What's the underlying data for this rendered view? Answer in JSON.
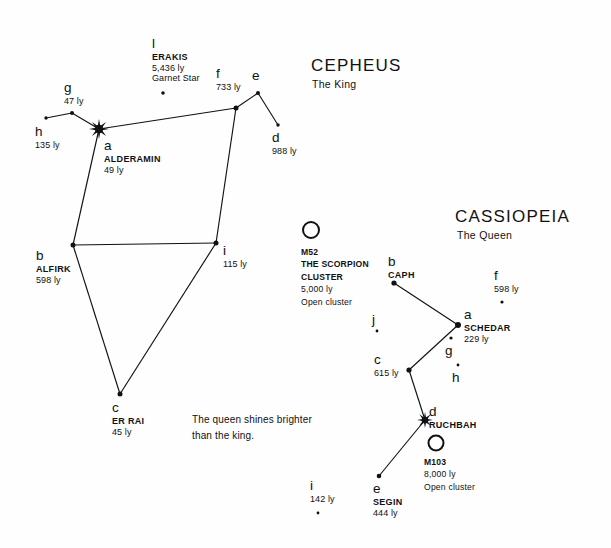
{
  "page": {
    "width": 611,
    "height": 548,
    "background": "#fefefe",
    "ink": "#111111"
  },
  "constellations": [
    {
      "id": "cepheus",
      "title": "CEPHEUS",
      "subtitle": "The King",
      "title_pos": {
        "x": 311,
        "y": 56
      },
      "sub_pos": {
        "x": 312,
        "y": 78
      }
    },
    {
      "id": "cassiopeia",
      "title": "CASSIOPEIA",
      "subtitle": "The Queen",
      "title_pos": {
        "x": 455,
        "y": 207
      },
      "sub_pos": {
        "x": 457,
        "y": 229
      }
    }
  ],
  "note": {
    "line1": "The queen shines brighter",
    "line2": "than the king.",
    "pos": {
      "x": 192,
      "y": 412
    }
  },
  "stars": [
    {
      "id": "cep-a",
      "bayer": "a",
      "name": "ALDERAMIN",
      "distance": "49 ly",
      "x": 99,
      "y": 129,
      "marker": "burst",
      "size": 10,
      "label_pos": {
        "x": 104,
        "y": 138
      },
      "label_align": "left"
    },
    {
      "id": "cep-b",
      "bayer": "b",
      "name": "ALFIRK",
      "distance": "598 ly",
      "x": 73,
      "y": 245,
      "marker": "dot",
      "size": 5,
      "label_pos": {
        "x": 36,
        "y": 248
      },
      "label_align": "left"
    },
    {
      "id": "cep-c",
      "bayer": "c",
      "name": "ER RAI",
      "distance": "45 ly",
      "x": 120,
      "y": 394,
      "marker": "dot",
      "size": 5,
      "label_pos": {
        "x": 112,
        "y": 400
      },
      "label_align": "left"
    },
    {
      "id": "cep-d",
      "bayer": "d",
      "name": "",
      "distance": "988 ly",
      "x": 278,
      "y": 125,
      "marker": "dot",
      "size": 3.4,
      "label_pos": {
        "x": 272,
        "y": 130
      },
      "label_align": "left"
    },
    {
      "id": "cep-e",
      "bayer": "e",
      "name": "",
      "distance": "",
      "x": 258,
      "y": 93,
      "marker": "dot",
      "size": 4,
      "label_pos": {
        "x": 252,
        "y": 68
      },
      "label_align": "left"
    },
    {
      "id": "cep-f",
      "bayer": "f",
      "name": "",
      "distance": "733 ly",
      "x": 236,
      "y": 108,
      "marker": "dot",
      "size": 5,
      "label_pos": {
        "x": 216,
        "y": 66
      },
      "label_align": "left"
    },
    {
      "id": "cep-g",
      "bayer": "g",
      "name": "",
      "distance": "47 ly",
      "x": 72,
      "y": 113,
      "marker": "dot",
      "size": 4,
      "label_pos": {
        "x": 64,
        "y": 80
      },
      "label_align": "left"
    },
    {
      "id": "cep-h",
      "bayer": "h",
      "name": "",
      "distance": "135 ly",
      "x": 46,
      "y": 118,
      "marker": "dot",
      "size": 3.4,
      "label_pos": {
        "x": 35,
        "y": 124
      },
      "label_align": "left"
    },
    {
      "id": "cep-i",
      "bayer": "i",
      "name": "",
      "distance": "115 ly",
      "x": 216,
      "y": 243,
      "marker": "dot",
      "size": 5,
      "label_pos": {
        "x": 223,
        "y": 243
      },
      "label_align": "left"
    },
    {
      "id": "cep-l",
      "bayer": "l",
      "name": "ERAKIS",
      "distance": "5,436 ly",
      "x": 163,
      "y": 93,
      "marker": "dot",
      "size": 3.6,
      "label_pos": {
        "x": 152,
        "y": 36
      },
      "label_align": "left",
      "extra": "Garnet Star"
    },
    {
      "id": "cas-a",
      "bayer": "a",
      "name": "SCHEDAR",
      "distance": "229 ly",
      "x": 458,
      "y": 325,
      "marker": "dot",
      "size": 6,
      "label_pos": {
        "x": 464,
        "y": 307
      },
      "label_align": "left"
    },
    {
      "id": "cas-b",
      "bayer": "b",
      "name": "CAPH",
      "distance": "",
      "x": 394,
      "y": 283,
      "marker": "dot",
      "size": 5.2,
      "label_pos": {
        "x": 388,
        "y": 254
      },
      "label_align": "left"
    },
    {
      "id": "cas-c",
      "bayer": "c",
      "name": "",
      "distance": "615 ly",
      "x": 409,
      "y": 370,
      "marker": "dot",
      "size": 5.2,
      "label_pos": {
        "x": 374,
        "y": 352
      },
      "label_align": "left"
    },
    {
      "id": "cas-d",
      "bayer": "d",
      "name": "RUCHBAH",
      "distance": "",
      "x": 425,
      "y": 420,
      "marker": "burst",
      "size": 8,
      "label_pos": {
        "x": 429,
        "y": 404
      },
      "label_align": "left"
    },
    {
      "id": "cas-e",
      "bayer": "e",
      "name": "SEGIN",
      "distance": "444 ly",
      "x": 379,
      "y": 476,
      "marker": "dot",
      "size": 4.6,
      "label_pos": {
        "x": 373,
        "y": 481
      },
      "label_align": "left"
    },
    {
      "id": "cas-f",
      "bayer": "f",
      "name": "",
      "distance": "598 ly",
      "x": 502,
      "y": 302,
      "marker": "dot",
      "size": 3.2,
      "label_pos": {
        "x": 494,
        "y": 268
      },
      "label_align": "left"
    },
    {
      "id": "cas-g",
      "bayer": "g",
      "name": "",
      "distance": "",
      "x": 451,
      "y": 338,
      "marker": "dot",
      "size": 3.2,
      "label_pos": {
        "x": 445,
        "y": 343
      },
      "label_align": "left"
    },
    {
      "id": "cas-h",
      "bayer": "h",
      "name": "",
      "distance": "",
      "x": 458,
      "y": 365,
      "marker": "dot",
      "size": 2.8,
      "label_pos": {
        "x": 452,
        "y": 370
      },
      "label_align": "left"
    },
    {
      "id": "cas-i",
      "bayer": "i",
      "name": "",
      "distance": "142 ly",
      "x": 318,
      "y": 513,
      "marker": "dot",
      "size": 2.8,
      "label_pos": {
        "x": 310,
        "y": 478
      },
      "label_align": "left"
    },
    {
      "id": "cas-j",
      "bayer": "j",
      "name": "",
      "distance": "",
      "x": 377,
      "y": 331,
      "marker": "dot",
      "size": 2.8,
      "label_pos": {
        "x": 372,
        "y": 312
      },
      "label_align": "left"
    }
  ],
  "lines": [
    {
      "id": "cep-h-g",
      "from": "cep-h",
      "to": "cep-g"
    },
    {
      "id": "cep-g-a",
      "from": "cep-g",
      "to": "cep-a"
    },
    {
      "id": "cep-a-f",
      "from": "cep-a",
      "to": "cep-f"
    },
    {
      "id": "cep-f-e",
      "from": "cep-f",
      "to": "cep-e"
    },
    {
      "id": "cep-e-d",
      "from": "cep-e",
      "to": "cep-d"
    },
    {
      "id": "cep-a-b",
      "from": "cep-a",
      "to": "cep-b"
    },
    {
      "id": "cep-b-i",
      "from": "cep-b",
      "to": "cep-i"
    },
    {
      "id": "cep-f-i",
      "from": "cep-f",
      "to": "cep-i"
    },
    {
      "id": "cep-b-c",
      "from": "cep-b",
      "to": "cep-c"
    },
    {
      "id": "cep-c-i",
      "from": "cep-c",
      "to": "cep-i"
    },
    {
      "id": "cas-b-a",
      "from": "cas-b",
      "to": "cas-a"
    },
    {
      "id": "cas-a-c",
      "from": "cas-a",
      "to": "cas-c"
    },
    {
      "id": "cas-c-d",
      "from": "cas-c",
      "to": "cas-d"
    },
    {
      "id": "cas-d-e",
      "from": "cas-d",
      "to": "cas-e"
    }
  ],
  "clusters": [
    {
      "id": "m52",
      "symbol": "open-circle",
      "x": 311,
      "y": 230,
      "r": 8,
      "name": "M52",
      "alt_name_1": "THE SCORPION",
      "alt_name_2": "CLUSTER",
      "distance": "5,000 ly",
      "type": "Open cluster",
      "label_pos": {
        "x": 301,
        "y": 246
      }
    },
    {
      "id": "m103",
      "symbol": "open-circle",
      "x": 436,
      "y": 443,
      "r": 7.5,
      "name": "M103",
      "alt_name_1": "",
      "alt_name_2": "",
      "distance": "8,000 ly",
      "type": "Open cluster",
      "label_pos": {
        "x": 424,
        "y": 456
      }
    }
  ]
}
